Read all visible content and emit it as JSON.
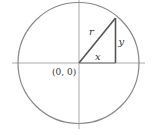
{
  "diagram": {
    "type": "unit-circle-right-triangle",
    "origin_label": "(0, 0)",
    "labels": {
      "hypotenuse": "r",
      "horizontal_leg": "x",
      "vertical_leg": "y"
    },
    "colors": {
      "circle": "#888888",
      "axes": "#aaaaaa",
      "triangle": "#555555",
      "text": "#333333"
    }
  }
}
